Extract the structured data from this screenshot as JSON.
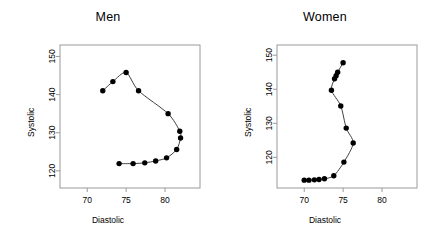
{
  "figure": {
    "background": "#ffffff",
    "point_color": "#000000",
    "line_color": "#2b2b2b",
    "frame_color": "#9a9a9a",
    "width": 433,
    "height": 239
  },
  "panels": [
    {
      "key": "men",
      "title": "Men"
    },
    {
      "key": "women",
      "title": "Women"
    }
  ],
  "chart_data": [
    {
      "type": "scatter",
      "title": "Men",
      "xlabel": "Diastolic",
      "ylabel": "Systolic",
      "xlim": [
        66.5,
        84.5
      ],
      "ylim": [
        115.5,
        153.0
      ],
      "xticks": [
        70,
        75,
        80
      ],
      "yticks": [
        120,
        130,
        140,
        150
      ],
      "xtick_labels": [
        "70",
        "75",
        "80"
      ],
      "ytick_labels": [
        "120",
        "130",
        "140",
        "150"
      ],
      "grid": false,
      "legend": "none",
      "connected": true,
      "series": [
        {
          "name": "Men",
          "x": [
            72.0,
            73.3,
            75.0,
            76.6,
            80.4,
            81.9,
            82.0,
            81.5,
            80.2,
            78.8,
            77.4,
            75.9,
            74.1
          ],
          "y": [
            141.0,
            143.4,
            145.8,
            141.0,
            135.0,
            130.4,
            128.6,
            125.6,
            123.4,
            122.6,
            122.1,
            121.9,
            121.9
          ]
        }
      ]
    },
    {
      "type": "scatter",
      "title": "Women",
      "xlabel": "Diastolic",
      "ylabel": "Systolic",
      "xlim": [
        66.5,
        84.5
      ],
      "ylim": [
        111.0,
        153.0
      ],
      "xticks": [
        70,
        75,
        80
      ],
      "yticks": [
        120,
        130,
        140,
        150
      ],
      "xtick_labels": [
        "70",
        "75",
        "80"
      ],
      "ytick_labels": [
        "120",
        "130",
        "140",
        "150"
      ],
      "grid": false,
      "legend": "none",
      "connected": true,
      "series": [
        {
          "name": "Women",
          "x": [
            75.0,
            74.3,
            74.1,
            73.9,
            73.5,
            74.7,
            75.4,
            76.3,
            75.1,
            73.8,
            72.6,
            71.9,
            71.3,
            70.6,
            70.0
          ],
          "y": [
            147.8,
            145.0,
            144.0,
            143.1,
            139.7,
            135.1,
            128.6,
            124.2,
            118.6,
            114.6,
            113.7,
            113.5,
            113.4,
            113.3,
            113.3
          ]
        }
      ]
    }
  ]
}
